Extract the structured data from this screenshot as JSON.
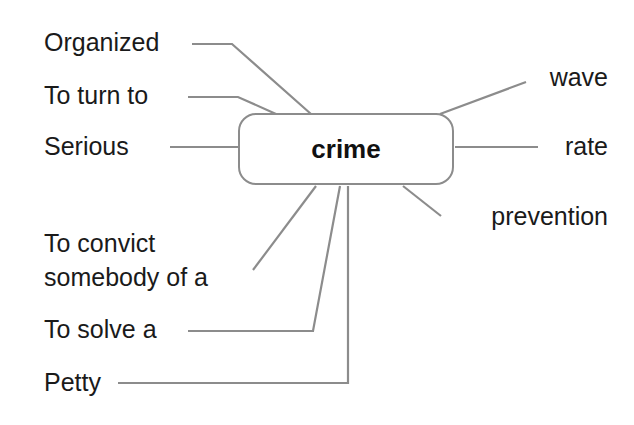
{
  "center": {
    "label": "crime"
  },
  "left_collocations": [
    {
      "id": "organized",
      "label": "Organized"
    },
    {
      "id": "turn-to",
      "label": "To turn to"
    },
    {
      "id": "serious",
      "label": "Serious"
    },
    {
      "id": "convict",
      "line1": "To convict",
      "line2": "somebody of a"
    },
    {
      "id": "solve",
      "label": "To solve a"
    },
    {
      "id": "petty",
      "label": "Petty"
    }
  ],
  "right_collocations": [
    {
      "id": "wave",
      "label": "wave"
    },
    {
      "id": "rate",
      "label": "rate"
    },
    {
      "id": "prevention",
      "label": "prevention"
    }
  ],
  "colors": {
    "line": "#8c8c8c",
    "text": "#1a1a1a"
  }
}
